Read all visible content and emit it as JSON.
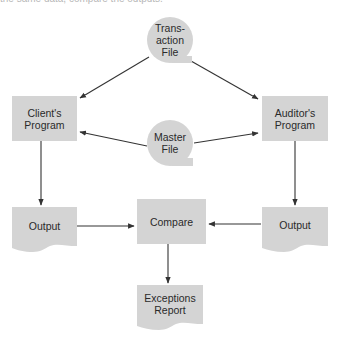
{
  "caption_fragment": "the same data, compare the outputs.",
  "colors": {
    "shape_fill": "#d4d4d4",
    "line": "#333333",
    "text": "#2a2a2a",
    "background": "#ffffff"
  },
  "nodes": {
    "transaction_file": {
      "type": "data-file",
      "label": "Trans-\naction\nFile"
    },
    "master_file": {
      "type": "data-file",
      "label": "Master\nFile"
    },
    "clients_program": {
      "type": "process",
      "label": "Client's\nProgram"
    },
    "auditors_program": {
      "type": "process",
      "label": "Auditor's\nProgram"
    },
    "output_left": {
      "type": "document",
      "label": "Output"
    },
    "output_right": {
      "type": "document",
      "label": "Output"
    },
    "compare": {
      "type": "process",
      "label": "Compare"
    },
    "exceptions_report": {
      "type": "document",
      "label": "Exceptions\nReport"
    }
  },
  "edges": [
    {
      "from": "Transaction File",
      "to": "Client's Program"
    },
    {
      "from": "Transaction File",
      "to": "Auditor's Program"
    },
    {
      "from": "Master File",
      "to": "Client's Program"
    },
    {
      "from": "Master File",
      "to": "Auditor's Program"
    },
    {
      "from": "Client's Program",
      "to": "Output (left)"
    },
    {
      "from": "Auditor's Program",
      "to": "Output (right)"
    },
    {
      "from": "Output (left)",
      "to": "Compare"
    },
    {
      "from": "Output (right)",
      "to": "Compare"
    },
    {
      "from": "Compare",
      "to": "Exceptions Report"
    }
  ]
}
